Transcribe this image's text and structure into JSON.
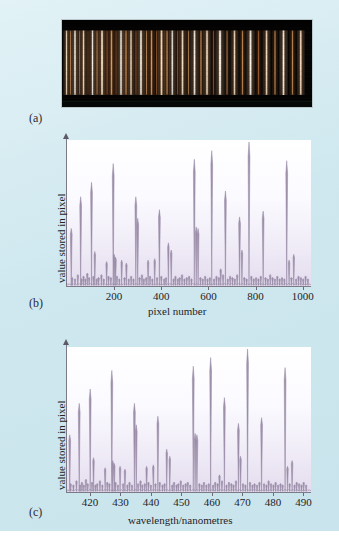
{
  "figure": {
    "background_color": "#cfe8ef",
    "panel_letters": {
      "a": "(a)",
      "b": "(b)",
      "c": "(c)"
    }
  },
  "panel_a": {
    "name": "emission-spectrum-photograph",
    "description": "photograph of an emission line spectrum",
    "background_color": "#050404",
    "line_colors": [
      "#fff6ea",
      "#ffd9a8",
      "#e8a866",
      "#c87b3c",
      "#8c4f20"
    ],
    "lines": [
      {
        "x": 0.018,
        "width": 0.009,
        "intensity": 0.82,
        "hue": "warm-white"
      },
      {
        "x": 0.034,
        "width": 0.008,
        "intensity": 0.55,
        "hue": "amber"
      },
      {
        "x": 0.052,
        "width": 0.01,
        "intensity": 0.95,
        "hue": "white"
      },
      {
        "x": 0.07,
        "width": 0.007,
        "intensity": 0.45,
        "hue": "amber"
      },
      {
        "x": 0.086,
        "width": 0.01,
        "intensity": 0.88,
        "hue": "warm-white"
      },
      {
        "x": 0.104,
        "width": 0.007,
        "intensity": 0.4,
        "hue": "orange"
      },
      {
        "x": 0.122,
        "width": 0.01,
        "intensity": 0.92,
        "hue": "white"
      },
      {
        "x": 0.14,
        "width": 0.008,
        "intensity": 0.6,
        "hue": "amber"
      },
      {
        "x": 0.16,
        "width": 0.011,
        "intensity": 0.97,
        "hue": "warm-white"
      },
      {
        "x": 0.18,
        "width": 0.008,
        "intensity": 0.52,
        "hue": "orange"
      },
      {
        "x": 0.198,
        "width": 0.01,
        "intensity": 0.86,
        "hue": "amber"
      },
      {
        "x": 0.216,
        "width": 0.007,
        "intensity": 0.44,
        "hue": "orange"
      },
      {
        "x": 0.236,
        "width": 0.011,
        "intensity": 0.93,
        "hue": "white"
      },
      {
        "x": 0.256,
        "width": 0.009,
        "intensity": 0.7,
        "hue": "amber"
      },
      {
        "x": 0.276,
        "width": 0.01,
        "intensity": 0.84,
        "hue": "warm-white"
      },
      {
        "x": 0.296,
        "width": 0.008,
        "intensity": 0.5,
        "hue": "orange"
      },
      {
        "x": 0.316,
        "width": 0.011,
        "intensity": 0.96,
        "hue": "white"
      },
      {
        "x": 0.338,
        "width": 0.008,
        "intensity": 0.58,
        "hue": "amber"
      },
      {
        "x": 0.358,
        "width": 0.01,
        "intensity": 0.8,
        "hue": "amber"
      },
      {
        "x": 0.378,
        "width": 0.007,
        "intensity": 0.42,
        "hue": "orange"
      },
      {
        "x": 0.398,
        "width": 0.012,
        "intensity": 0.99,
        "hue": "warm-white"
      },
      {
        "x": 0.42,
        "width": 0.009,
        "intensity": 0.66,
        "hue": "amber"
      },
      {
        "x": 0.441,
        "width": 0.01,
        "intensity": 0.88,
        "hue": "white"
      },
      {
        "x": 0.462,
        "width": 0.008,
        "intensity": 0.48,
        "hue": "orange"
      },
      {
        "x": 0.482,
        "width": 0.011,
        "intensity": 0.91,
        "hue": "warm-white"
      },
      {
        "x": 0.506,
        "width": 0.008,
        "intensity": 0.54,
        "hue": "amber"
      },
      {
        "x": 0.53,
        "width": 0.011,
        "intensity": 0.94,
        "hue": "white"
      },
      {
        "x": 0.556,
        "width": 0.009,
        "intensity": 0.62,
        "hue": "amber"
      },
      {
        "x": 0.58,
        "width": 0.011,
        "intensity": 0.9,
        "hue": "warm-white"
      },
      {
        "x": 0.606,
        "width": 0.008,
        "intensity": 0.46,
        "hue": "orange"
      },
      {
        "x": 0.632,
        "width": 0.012,
        "intensity": 0.97,
        "hue": "white"
      },
      {
        "x": 0.66,
        "width": 0.008,
        "intensity": 0.5,
        "hue": "amber"
      },
      {
        "x": 0.69,
        "width": 0.011,
        "intensity": 0.86,
        "hue": "warm-white"
      },
      {
        "x": 0.722,
        "width": 0.009,
        "intensity": 0.64,
        "hue": "amber"
      },
      {
        "x": 0.754,
        "width": 0.012,
        "intensity": 0.98,
        "hue": "white"
      },
      {
        "x": 0.786,
        "width": 0.009,
        "intensity": 0.6,
        "hue": "orange"
      },
      {
        "x": 0.818,
        "width": 0.011,
        "intensity": 0.89,
        "hue": "warm-white"
      },
      {
        "x": 0.852,
        "width": 0.009,
        "intensity": 0.58,
        "hue": "amber"
      },
      {
        "x": 0.886,
        "width": 0.012,
        "intensity": 0.99,
        "hue": "white"
      },
      {
        "x": 0.922,
        "width": 0.009,
        "intensity": 0.62,
        "hue": "amber"
      },
      {
        "x": 0.955,
        "width": 0.011,
        "intensity": 0.87,
        "hue": "warm-white"
      }
    ]
  },
  "chart_data": [
    {
      "id": "panel_b",
      "type": "line",
      "title": "",
      "xlabel": "pixel number",
      "ylabel": "value stored in pixel",
      "xlim": [
        0,
        1035
      ],
      "ylim": [
        0,
        1.0
      ],
      "xticks": [
        200,
        400,
        600,
        800,
        1000
      ],
      "xticklabels": [
        "200",
        "400",
        "600",
        "800",
        "1000"
      ],
      "yticks": [],
      "yticklabels": [],
      "grid": false,
      "legend": null,
      "x": [
        18,
        22,
        34,
        46,
        58,
        62,
        70,
        78,
        86,
        94,
        104,
        112,
        118,
        126,
        134,
        146,
        156,
        168,
        176,
        186,
        196,
        200,
        206,
        212,
        222,
        232,
        244,
        252,
        262,
        272,
        282,
        292,
        300,
        308,
        318,
        326,
        336,
        344,
        352,
        362,
        372,
        382,
        392,
        400,
        412,
        420,
        430,
        442,
        452,
        460,
        470,
        478,
        488,
        498,
        508,
        518,
        528,
        540,
        548,
        556,
        566,
        576,
        586,
        596,
        606,
        614,
        624,
        634,
        644,
        652,
        662,
        672,
        682,
        692,
        702,
        712,
        722,
        732,
        742,
        752,
        762,
        772,
        782,
        792,
        802,
        812,
        822,
        832,
        842,
        852,
        862,
        872,
        882,
        892,
        902,
        912,
        922,
        932,
        942,
        952,
        962,
        972,
        982,
        992,
        1002,
        1012,
        1022
      ],
      "y": [
        0.4,
        0.06,
        0.05,
        0.08,
        0.62,
        0.05,
        0.07,
        0.05,
        0.09,
        0.06,
        0.72,
        0.07,
        0.24,
        0.05,
        0.06,
        0.08,
        0.05,
        0.17,
        0.07,
        0.06,
        0.85,
        0.22,
        0.2,
        0.07,
        0.05,
        0.18,
        0.06,
        0.16,
        0.05,
        0.07,
        0.05,
        0.62,
        0.47,
        0.06,
        0.08,
        0.05,
        0.06,
        0.18,
        0.07,
        0.05,
        0.19,
        0.06,
        0.53,
        0.07,
        0.05,
        0.06,
        0.3,
        0.25,
        0.05,
        0.07,
        0.05,
        0.06,
        0.08,
        0.05,
        0.06,
        0.07,
        0.05,
        0.88,
        0.41,
        0.4,
        0.06,
        0.05,
        0.07,
        0.05,
        0.06,
        0.94,
        0.05,
        0.07,
        0.06,
        0.12,
        0.08,
        0.66,
        0.05,
        0.07,
        0.06,
        0.05,
        0.08,
        0.48,
        0.25,
        0.06,
        0.05,
        1.0,
        0.07,
        0.05,
        0.06,
        0.05,
        0.07,
        0.52,
        0.06,
        0.05,
        0.08,
        0.06,
        0.05,
        0.07,
        0.05,
        0.06,
        0.05,
        0.87,
        0.18,
        0.06,
        0.22,
        0.05,
        0.07,
        0.06,
        0.05,
        0.07,
        0.05
      ]
    },
    {
      "id": "panel_c",
      "type": "line",
      "title": "",
      "xlabel": "wavelength/nanometres",
      "ylabel": "value stored in pixel",
      "xlim": [
        412.5,
        492.5
      ],
      "ylim": [
        0,
        1.0
      ],
      "xticks": [
        420,
        430,
        440,
        450,
        460,
        470,
        480,
        490
      ],
      "xticklabels": [
        "420",
        "430",
        "440",
        "450",
        "460",
        "470",
        "480",
        "490"
      ],
      "yticks": [],
      "yticklabels": [],
      "grid": false,
      "legend": null,
      "x": [
        413.4,
        413.7,
        414.6,
        415.6,
        416.5,
        416.8,
        417.4,
        418.0,
        418.7,
        419.3,
        420.1,
        420.7,
        421.2,
        421.8,
        422.4,
        423.3,
        424.1,
        425.0,
        425.7,
        426.4,
        427.2,
        427.5,
        428.0,
        428.4,
        429.2,
        429.9,
        430.9,
        431.5,
        432.3,
        433.0,
        433.8,
        434.6,
        435.2,
        435.8,
        436.6,
        437.2,
        438.0,
        438.6,
        439.2,
        440.0,
        440.8,
        441.5,
        442.3,
        442.9,
        443.8,
        444.5,
        445.2,
        446.2,
        447.0,
        447.6,
        448.4,
        449.0,
        449.8,
        450.6,
        451.4,
        452.1,
        452.9,
        453.9,
        454.5,
        455.1,
        455.9,
        456.7,
        457.4,
        458.2,
        459.0,
        459.6,
        460.4,
        461.1,
        461.9,
        462.5,
        463.3,
        464.1,
        464.8,
        465.6,
        466.4,
        467.1,
        467.9,
        468.7,
        469.4,
        470.2,
        471.0,
        471.7,
        472.5,
        473.3,
        474.0,
        474.8,
        475.6,
        476.3,
        477.1,
        477.9,
        478.6,
        479.4,
        480.2,
        480.9,
        481.7,
        482.5,
        483.2,
        484.0,
        484.8,
        485.5,
        486.3,
        487.1,
        487.8,
        488.6,
        489.4,
        490.1,
        490.9
      ],
      "y": [
        0.4,
        0.06,
        0.05,
        0.08,
        0.62,
        0.05,
        0.07,
        0.05,
        0.09,
        0.06,
        0.72,
        0.07,
        0.24,
        0.05,
        0.06,
        0.08,
        0.05,
        0.17,
        0.07,
        0.06,
        0.85,
        0.22,
        0.2,
        0.07,
        0.05,
        0.18,
        0.06,
        0.16,
        0.05,
        0.07,
        0.05,
        0.62,
        0.47,
        0.06,
        0.08,
        0.05,
        0.06,
        0.18,
        0.07,
        0.05,
        0.19,
        0.06,
        0.53,
        0.07,
        0.05,
        0.06,
        0.3,
        0.25,
        0.05,
        0.07,
        0.05,
        0.06,
        0.08,
        0.05,
        0.06,
        0.07,
        0.05,
        0.88,
        0.41,
        0.4,
        0.06,
        0.05,
        0.07,
        0.05,
        0.06,
        0.94,
        0.05,
        0.07,
        0.06,
        0.12,
        0.08,
        0.66,
        0.05,
        0.07,
        0.06,
        0.05,
        0.08,
        0.48,
        0.25,
        0.06,
        0.05,
        1.0,
        0.07,
        0.05,
        0.06,
        0.05,
        0.07,
        0.52,
        0.06,
        0.05,
        0.08,
        0.06,
        0.05,
        0.07,
        0.05,
        0.06,
        0.05,
        0.87,
        0.18,
        0.06,
        0.22,
        0.05,
        0.07,
        0.06,
        0.05,
        0.07,
        0.05
      ]
    }
  ]
}
